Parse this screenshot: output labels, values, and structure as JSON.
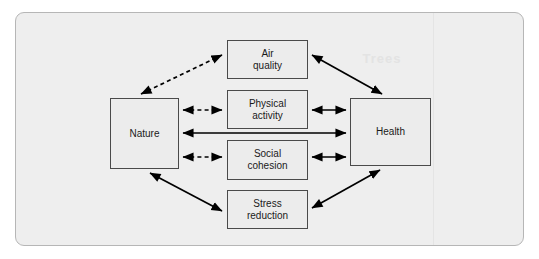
{
  "figure": {
    "width": 539,
    "height": 259,
    "panel_background": "#eeeeee",
    "panel_border": "#b6b6b6",
    "node_fill": "#ececec",
    "node_border": "#4a4a4a",
    "edge_color": "#000000",
    "watermark_text": "Trees"
  },
  "nodes": [
    {
      "id": "nature",
      "label": "Nature"
    },
    {
      "id": "air",
      "label": "Air\nquality"
    },
    {
      "id": "physical",
      "label": "Physical\nactivity"
    },
    {
      "id": "social",
      "label": "Social\ncohesion"
    },
    {
      "id": "stress",
      "label": "Stress\nreduction"
    },
    {
      "id": "health",
      "label": "Health"
    }
  ],
  "edges": [
    {
      "from": "nature",
      "to": "air",
      "style": "dashed",
      "arrows": "both"
    },
    {
      "from": "nature",
      "to": "physical",
      "style": "dashed",
      "arrows": "both"
    },
    {
      "from": "nature",
      "to": "social",
      "style": "dashed",
      "arrows": "both"
    },
    {
      "from": "nature",
      "to": "stress",
      "style": "solid",
      "arrows": "both"
    },
    {
      "from": "nature",
      "to": "health",
      "style": "solid",
      "arrows": "both"
    },
    {
      "from": "air",
      "to": "health",
      "style": "solid",
      "arrows": "both"
    },
    {
      "from": "physical",
      "to": "health",
      "style": "solid",
      "arrows": "both"
    },
    {
      "from": "social",
      "to": "health",
      "style": "solid",
      "arrows": "both"
    },
    {
      "from": "stress",
      "to": "health",
      "style": "solid",
      "arrows": "both"
    }
  ]
}
